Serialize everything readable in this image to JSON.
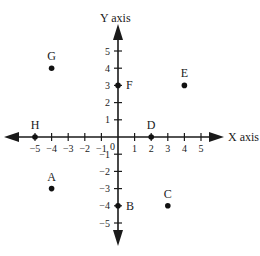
{
  "chart_data": {
    "type": "scatter",
    "title": "",
    "xlabel": "X axis",
    "ylabel": "Y axis",
    "xlim": [
      -5,
      5
    ],
    "ylim": [
      -5,
      5
    ],
    "grid": false,
    "origin_label": "0",
    "x_ticks": [
      -5,
      -4,
      -3,
      -2,
      -1,
      1,
      2,
      3,
      4,
      5
    ],
    "y_ticks": [
      5,
      4,
      3,
      2,
      1,
      -1,
      -2,
      -3,
      -4,
      -5
    ],
    "x_tick_labels": [
      "−5",
      "−4",
      "−3",
      "−2",
      "−1",
      "1",
      "2",
      "3",
      "4",
      "5"
    ],
    "y_tick_labels": [
      "5",
      "4",
      "3",
      "2",
      "1",
      "−1",
      "−2",
      "−3",
      "−4",
      "−5"
    ],
    "points": [
      {
        "label": "A",
        "x": -4,
        "y": -3
      },
      {
        "label": "B",
        "x": 0,
        "y": -4
      },
      {
        "label": "C",
        "x": 3,
        "y": -4
      },
      {
        "label": "D",
        "x": 2,
        "y": 0
      },
      {
        "label": "E",
        "x": 4,
        "y": 3
      },
      {
        "label": "F",
        "x": 0,
        "y": 3
      },
      {
        "label": "G",
        "x": -4,
        "y": 4
      },
      {
        "label": "H",
        "x": -5,
        "y": 0
      }
    ]
  },
  "colors": {
    "axis": "#1a1a1a",
    "point": "#111111",
    "background": "#ffffff"
  }
}
